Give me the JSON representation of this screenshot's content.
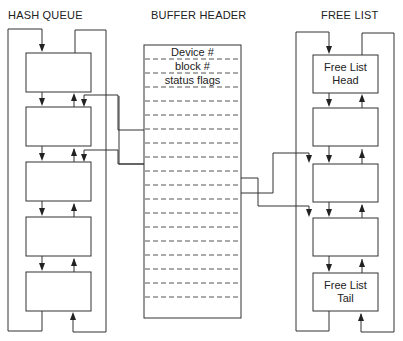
{
  "titles": {
    "hash_queue": "HASH QUEUE",
    "buffer_header": "BUFFER HEADER",
    "free_list": "FREE LIST"
  },
  "buffer_header": {
    "fields": [
      "Device #",
      "block #",
      "status flags",
      "",
      "",
      "",
      "",
      "",
      "",
      "",
      "",
      "",
      "",
      "",
      "",
      "",
      "",
      "",
      ""
    ]
  },
  "hash_queue": {
    "node_count": 5
  },
  "free_list": {
    "head_label_line1": "Free List",
    "head_label_line2": "Head",
    "tail_label_line1": "Free List",
    "tail_label_line2": "Tail",
    "node_count": 5
  },
  "colors": {
    "line": "#333333",
    "dash": "#555555",
    "background": "#ffffff"
  }
}
